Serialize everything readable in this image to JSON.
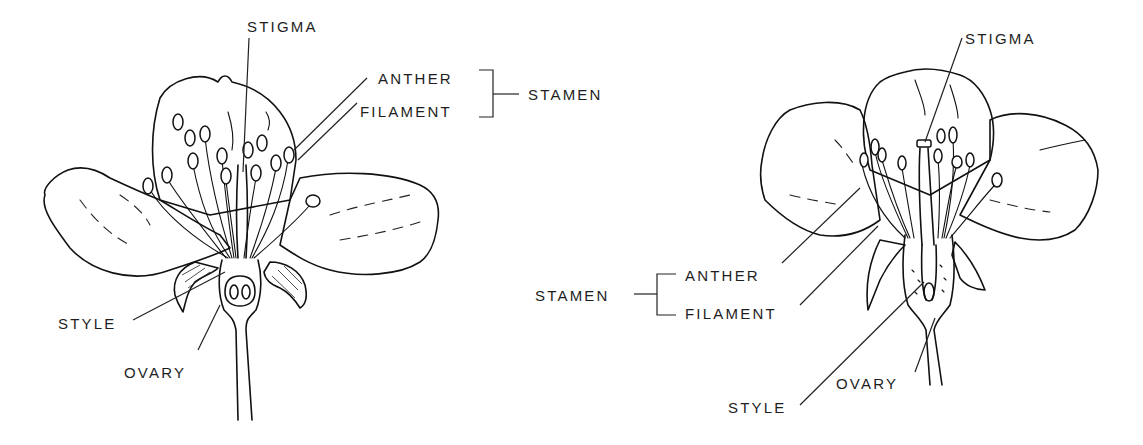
{
  "diagram": {
    "type": "labeled botanical illustration",
    "background": "#ffffff",
    "ink_color": "#111111",
    "flowers": [
      {
        "id": "left-flower",
        "labels": {
          "stigma": "STIGMA",
          "anther": "ANTHER",
          "filament": "FILAMENT",
          "stamen": "STAMEN",
          "style": "STYLE",
          "ovary": "OVARY"
        }
      },
      {
        "id": "right-flower",
        "labels": {
          "stigma": "STIGMA",
          "anther": "ANTHER",
          "filament": "FILAMENT",
          "stamen": "STAMEN",
          "style": "STYLE",
          "ovary": "OVARY"
        }
      }
    ],
    "groupings": [
      {
        "group": "STAMEN",
        "parts": [
          "ANTHER",
          "FILAMENT"
        ]
      }
    ]
  }
}
